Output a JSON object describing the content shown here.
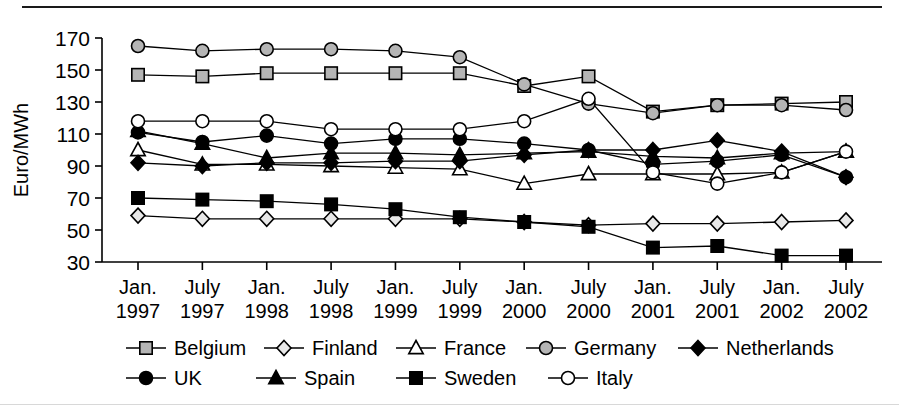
{
  "figure": {
    "ylabel": "Euro/MWh",
    "ytick_labels": [
      "170",
      "150",
      "130",
      "110",
      "90",
      "70",
      "50",
      "30"
    ],
    "xtick_labels_top": [
      "Jan.",
      "July",
      "Jan.",
      "July",
      "Jan.",
      "July",
      "Jan.",
      "July",
      "Jan.",
      "July",
      "Jan.",
      "July"
    ],
    "xtick_labels_bottom": [
      "1997",
      "1997",
      "1998",
      "1998",
      "1999",
      "1999",
      "2000",
      "2000",
      "2001",
      "2001",
      "2002",
      "2002"
    ],
    "legend_row1": [
      "Belgium",
      "Finland",
      "France",
      "Germany",
      "Netherlands"
    ],
    "legend_row2": [
      "UK",
      "Spain",
      "Sweden",
      "Italy"
    ]
  },
  "colors": {
    "line": "#000000",
    "grey_marker_fill": "#b5b5b5",
    "white_marker_fill": "#ffffff",
    "black_marker_fill": "#000000",
    "background": "#ffffff"
  },
  "chart_data": {
    "type": "line",
    "title": "",
    "xlabel": "",
    "ylabel": "Euro/MWh",
    "ylim": [
      30,
      170
    ],
    "ytick_step": 20,
    "grid": false,
    "legend_position": "bottom",
    "categories": [
      "Jan. 1997",
      "July 1997",
      "Jan. 1998",
      "July 1998",
      "Jan. 1999",
      "July 1999",
      "Jan. 2000",
      "July 2000",
      "Jan. 2001",
      "July 2001",
      "Jan. 2002",
      "July 2002"
    ],
    "series": [
      {
        "name": "Belgium",
        "marker": "square",
        "marker_fill": "#b5b5b5",
        "values": [
          147,
          146,
          148,
          148,
          148,
          148,
          140,
          146,
          124,
          128,
          129,
          130
        ]
      },
      {
        "name": "Finland",
        "marker": "diamond",
        "marker_fill": "#e8e8e8",
        "values": [
          59,
          57,
          57,
          57,
          57,
          57,
          55,
          53,
          54,
          54,
          55,
          56
        ]
      },
      {
        "name": "France",
        "marker": "triangle-up",
        "marker_fill": "#ffffff",
        "values": [
          100,
          91,
          91,
          90,
          89,
          88,
          79,
          85,
          85,
          85,
          86,
          99
        ]
      },
      {
        "name": "Germany",
        "marker": "circle",
        "marker_fill": "#b5b5b5",
        "values": [
          165,
          162,
          163,
          163,
          162,
          158,
          141,
          129,
          123,
          128,
          128,
          125
        ]
      },
      {
        "name": "Netherlands",
        "marker": "diamond",
        "marker_fill": "#000000",
        "values": [
          92,
          90,
          92,
          92,
          93,
          93,
          97,
          100,
          100,
          106,
          99,
          83
        ]
      },
      {
        "name": "UK",
        "marker": "circle",
        "marker_fill": "#000000",
        "values": [
          111,
          105,
          109,
          104,
          107,
          107,
          104,
          100,
          91,
          93,
          97,
          83
        ]
      },
      {
        "name": "Spain",
        "marker": "triangle-up",
        "marker_fill": "#000000",
        "values": [
          112,
          104,
          95,
          98,
          98,
          97,
          98,
          99,
          96,
          95,
          98,
          99
        ]
      },
      {
        "name": "Sweden",
        "marker": "square",
        "marker_fill": "#000000",
        "values": [
          70,
          69,
          68,
          66,
          63,
          58,
          55,
          52,
          39,
          40,
          34,
          34
        ]
      },
      {
        "name": "Italy",
        "marker": "circle",
        "marker_fill": "#ffffff",
        "values": [
          118,
          118,
          118,
          113,
          113,
          113,
          118,
          132,
          86,
          79,
          86,
          99
        ]
      }
    ]
  }
}
